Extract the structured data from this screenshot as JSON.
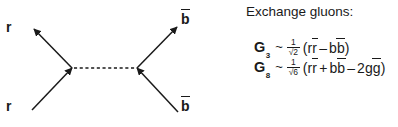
{
  "diagram": {
    "name": "gluon-exchange-feynman-diagram",
    "legs": [
      {
        "id": "r-top",
        "label": "r",
        "overbar": false,
        "position": "upper-left",
        "arrow": "outgoing"
      },
      {
        "id": "r-bot",
        "label": "r",
        "overbar": false,
        "position": "lower-left",
        "arrow": "incoming"
      },
      {
        "id": "b-top",
        "label": "b",
        "overbar": true,
        "position": "upper-right",
        "arrow": "outgoing"
      },
      {
        "id": "b-bot",
        "label": "b",
        "overbar": true,
        "position": "lower-right",
        "arrow": "incoming"
      }
    ],
    "propagator": {
      "style": "dashed",
      "label": "gluon-propagator"
    },
    "line_color": "#1a1a1a"
  },
  "gluons": {
    "heading": "Exchange gluons:",
    "formulas": [
      {
        "symbol": "G",
        "subscript": "3",
        "relation": "~",
        "numerator": "1",
        "denominator": "√2",
        "open_paren": "(",
        "terms": [
          {
            "text": "r",
            "overbar": false
          },
          {
            "text": "r",
            "overbar": true
          },
          {
            "op": "–"
          },
          {
            "text": "b",
            "overbar": false
          },
          {
            "text": "b",
            "overbar": true
          }
        ],
        "close_paren": ")"
      },
      {
        "symbol": "G",
        "subscript": "8",
        "relation": "~",
        "numerator": "1",
        "denominator": "√6",
        "open_paren": "(",
        "terms": [
          {
            "text": "r",
            "overbar": false
          },
          {
            "text": "r",
            "overbar": true
          },
          {
            "op": "+"
          },
          {
            "text": "b",
            "overbar": false
          },
          {
            "text": "b",
            "overbar": true
          },
          {
            "op": "–"
          },
          {
            "text": "2g",
            "overbar": false
          },
          {
            "text": "g",
            "overbar": true
          }
        ],
        "close_paren": ")"
      }
    ]
  },
  "strings": {
    "g3_symbol": "G",
    "g3_subscript": "3",
    "g3_relation": "~",
    "g3_num": "1",
    "g3_den": "√2",
    "g3_open": "(",
    "g3_r": "r",
    "g3_rbar": "r",
    "g3_minus": "–",
    "g3_b": "b",
    "g3_bbar": "b",
    "g3_close": ")",
    "g8_symbol": "G",
    "g8_subscript": "8",
    "g8_relation": "~",
    "g8_num": "1",
    "g8_den": "√6",
    "g8_open": "(",
    "g8_r": "r",
    "g8_rbar": "r",
    "g8_plus": "+",
    "g8_b": "b",
    "g8_bbar": "b",
    "g8_minus": "–",
    "g8_2g": "2g",
    "g8_gbar": "g",
    "g8_close": ")",
    "leg_r_top": "r",
    "leg_r_bot": "r",
    "leg_b_top": "b",
    "leg_b_bot": "b"
  }
}
